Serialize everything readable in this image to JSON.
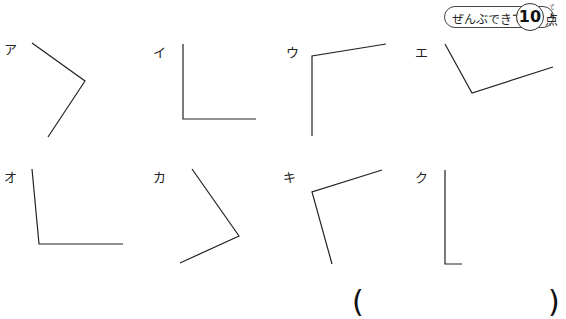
{
  "score": {
    "label": "ぜんぶできて",
    "points": "10",
    "unit": "点",
    "unit_ruby": "てん"
  },
  "figures": [
    {
      "label": "ア",
      "points": [
        [
          32,
          43
        ],
        [
          85,
          81
        ],
        [
          48,
          137
        ]
      ]
    },
    {
      "label": "イ",
      "points": [
        [
          183,
          44
        ],
        [
          183,
          119
        ],
        [
          256,
          119
        ]
      ]
    },
    {
      "label": "ウ",
      "points": [
        [
          386,
          44
        ],
        [
          312,
          56
        ],
        [
          312,
          136
        ]
      ]
    },
    {
      "label": "エ",
      "points": [
        [
          445,
          44
        ],
        [
          472,
          93
        ],
        [
          553,
          67
        ]
      ]
    },
    {
      "label": "オ",
      "points": [
        [
          32,
          169
        ],
        [
          39,
          244
        ],
        [
          123,
          244
        ]
      ]
    },
    {
      "label": "カ",
      "points": [
        [
          192,
          169
        ],
        [
          239,
          236
        ],
        [
          180,
          263
        ]
      ]
    },
    {
      "label": "キ",
      "points": [
        [
          382,
          170
        ],
        [
          312,
          192
        ],
        [
          332,
          264
        ]
      ]
    },
    {
      "label": "ク",
      "points": [
        [
          445,
          170
        ],
        [
          445,
          264
        ],
        [
          462,
          264
        ]
      ]
    }
  ],
  "answer": {
    "open": "(",
    "close": ")",
    "value": ""
  }
}
